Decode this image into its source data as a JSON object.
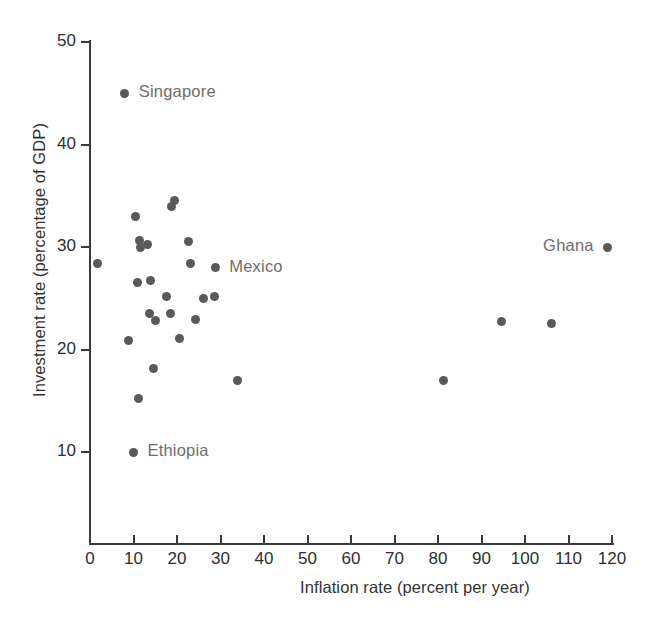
{
  "chart_data": {
    "type": "scatter",
    "title": "",
    "xlabel": "Inflation rate (percent per year)",
    "ylabel": "Investment rate (percentage of GDP)",
    "xlim": [
      0,
      120
    ],
    "ylim": [
      0,
      50
    ],
    "xticks": [
      0,
      10,
      20,
      30,
      40,
      50,
      60,
      70,
      80,
      90,
      100,
      110,
      120
    ],
    "yticks": [
      10,
      20,
      30,
      40,
      50
    ],
    "grid": false,
    "legend": "none",
    "point_color": "#595959",
    "axis_color": "#3a3a3a",
    "annotation_color": "#6e6e6e",
    "points": [
      {
        "x": 1.7,
        "y": 28.4,
        "label": ""
      },
      {
        "x": 8.0,
        "y": 45.0,
        "label": "Singapore"
      },
      {
        "x": 8.9,
        "y": 20.9,
        "label": ""
      },
      {
        "x": 10.5,
        "y": 33.0,
        "label": ""
      },
      {
        "x": 10.0,
        "y": 10.0,
        "label": "Ethiopia"
      },
      {
        "x": 11.3,
        "y": 30.6,
        "label": ""
      },
      {
        "x": 11.5,
        "y": 30.0,
        "label": ""
      },
      {
        "x": 11.0,
        "y": 26.5,
        "label": ""
      },
      {
        "x": 11.2,
        "y": 15.2,
        "label": ""
      },
      {
        "x": 13.3,
        "y": 30.2,
        "label": ""
      },
      {
        "x": 13.6,
        "y": 23.5,
        "label": ""
      },
      {
        "x": 14.0,
        "y": 26.7,
        "label": ""
      },
      {
        "x": 14.7,
        "y": 18.1,
        "label": ""
      },
      {
        "x": 15.0,
        "y": 22.8,
        "label": ""
      },
      {
        "x": 17.5,
        "y": 25.2,
        "label": ""
      },
      {
        "x": 18.7,
        "y": 34.0,
        "label": ""
      },
      {
        "x": 19.4,
        "y": 34.5,
        "label": ""
      },
      {
        "x": 18.4,
        "y": 23.5,
        "label": ""
      },
      {
        "x": 20.5,
        "y": 21.1,
        "label": ""
      },
      {
        "x": 23.0,
        "y": 28.4,
        "label": ""
      },
      {
        "x": 22.6,
        "y": 30.5,
        "label": ""
      },
      {
        "x": 24.2,
        "y": 22.9,
        "label": ""
      },
      {
        "x": 26.2,
        "y": 25.0,
        "label": ""
      },
      {
        "x": 28.6,
        "y": 25.2,
        "label": ""
      },
      {
        "x": 28.8,
        "y": 28.0,
        "label": "Mexico"
      },
      {
        "x": 33.8,
        "y": 17.0,
        "label": ""
      },
      {
        "x": 81.3,
        "y": 17.0,
        "label": ""
      },
      {
        "x": 94.5,
        "y": 22.7,
        "label": ""
      },
      {
        "x": 106.0,
        "y": 22.5,
        "label": ""
      },
      {
        "x": 119.0,
        "y": 30.0,
        "label": "Ghana"
      }
    ],
    "annotations": [
      {
        "text": "Singapore",
        "x": 8.0,
        "y": 45.0,
        "position": "right"
      },
      {
        "text": "Mexico",
        "x": 28.8,
        "y": 28.0,
        "position": "right"
      },
      {
        "text": "Ethiopia",
        "x": 10.0,
        "y": 10.0,
        "position": "right"
      },
      {
        "text": "Ghana",
        "x": 119.0,
        "y": 30.0,
        "position": "left"
      }
    ]
  }
}
